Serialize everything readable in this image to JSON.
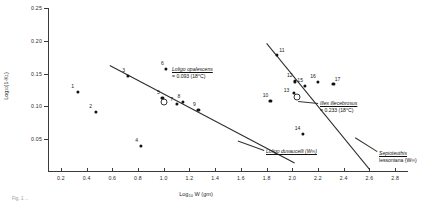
{
  "chart_data": {
    "type": "scatter",
    "title": "",
    "xlabel": "Log10 W (gm)",
    "ylabel": "Log10 (1-K1)",
    "xlim": [
      0.1,
      2.9
    ],
    "ylim": [
      0.0,
      0.25
    ],
    "grid": false,
    "legend": "none",
    "xticks": [
      "0.2",
      "0.4",
      "0.6",
      "0.8",
      "1.0",
      "1.2",
      "1.4",
      "1.6",
      "1.8",
      "2.0",
      "2.2",
      "2.4",
      "2.6",
      "2.8"
    ],
    "xtick_values": [
      0.2,
      0.4,
      0.6,
      0.8,
      1.0,
      1.2,
      1.4,
      1.6,
      1.8,
      2.0,
      2.2,
      2.4,
      2.6,
      2.8
    ],
    "yticks": [
      "0.05",
      "0.10",
      "0.15",
      "0.20",
      "0.25"
    ],
    "ytick_values": [
      0.05,
      0.1,
      0.15,
      0.2,
      0.25
    ],
    "series": [
      {
        "name": "Loligo opalescens group",
        "marker": "filled-circle",
        "points": [
          {
            "label": "1",
            "x": 0.33,
            "y": 0.122
          },
          {
            "label": "2",
            "x": 0.47,
            "y": 0.092
          },
          {
            "label": "3",
            "x": 0.72,
            "y": 0.147
          },
          {
            "label": "4",
            "x": 0.82,
            "y": 0.04
          },
          {
            "label": "5",
            "x": 0.99,
            "y": 0.113
          },
          {
            "label": "6",
            "x": 1.02,
            "y": 0.157
          },
          {
            "label": "7",
            "x": 1.1,
            "y": 0.104
          },
          {
            "label": "8",
            "x": 1.15,
            "y": 0.107
          },
          {
            "label": "9",
            "x": 1.27,
            "y": 0.095
          }
        ]
      },
      {
        "name": "Illex illecebrosus group",
        "marker": "filled-circle",
        "points": [
          {
            "label": "10",
            "x": 1.83,
            "y": 0.108
          },
          {
            "label": "11",
            "x": 1.88,
            "y": 0.178
          },
          {
            "label": "12",
            "x": 2.02,
            "y": 0.138
          },
          {
            "label": "13",
            "x": 2.01,
            "y": 0.12
          },
          {
            "label": "14",
            "x": 2.08,
            "y": 0.058
          },
          {
            "label": "15",
            "x": 2.1,
            "y": 0.131
          },
          {
            "label": "16",
            "x": 2.2,
            "y": 0.137
          },
          {
            "label": "17",
            "x": 2.32,
            "y": 0.134
          }
        ]
      },
      {
        "name": "Open circle markers",
        "marker": "open-circle",
        "points": [
          {
            "label": "",
            "x": 1.0,
            "y": 0.106
          },
          {
            "label": "",
            "x": 2.04,
            "y": 0.114
          }
        ]
      }
    ],
    "trendlines": [
      {
        "name": "loligo-opalescens-regression",
        "x1": 0.58,
        "y1": 0.163,
        "x2": 2.02,
        "y2": 0.014
      },
      {
        "name": "illex-illecebrosus-regression",
        "x1": 1.8,
        "y1": 0.196,
        "x2": 2.6,
        "y2": 0.004
      }
    ],
    "annotations": [
      {
        "name": "loligo-opalescens",
        "species": "Loligo opalescens",
        "value": "= 0.093 (18°C)"
      },
      {
        "name": "illex-illecebrosus",
        "species": "Illex illecebrosus",
        "value": "= 0.233 (18°C)"
      },
      {
        "name": "loligo-duvaucelli",
        "species": "Loligo duvaucelli (W∞)",
        "value": ""
      },
      {
        "name": "sepioteuthis-lessoniana",
        "species": "Sepioteuthis",
        "value": "lessoniana (W∞)"
      }
    ]
  },
  "figure": {
    "caption": "Fig. 1 ..."
  }
}
